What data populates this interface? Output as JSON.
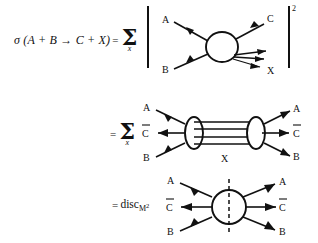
{
  "document": {
    "kind": "physics-equation-figure",
    "background_color": "#ffffff",
    "ink_color": "#111111"
  },
  "equation": {
    "line1": {
      "lhs": "σ (A + B → C + X)",
      "equals": "=",
      "sum_glyph": "Σ",
      "sum_subscript": "x",
      "amplitude_squared_exponent": "2"
    },
    "line2": {
      "equals": "=",
      "sum_glyph": "Σ",
      "sum_subscript": "x"
    },
    "line3": {
      "equals": "=",
      "operator": "disc",
      "operator_subscript": "M",
      "operator_subscript_exponent": "2"
    }
  },
  "diagram1": {
    "name": "amplitude-blob",
    "incoming": [
      "A",
      "B"
    ],
    "outgoing_single": "C",
    "outgoing_bundle_label": "X",
    "bundle_line_count": 3
  },
  "diagram2": {
    "name": "ladder-cut-diagram",
    "left_labels": [
      "A",
      "Ĉ",
      "B"
    ],
    "right_labels": [
      "A",
      "Ĉ",
      "B"
    ],
    "left_labels_plain": [
      "A",
      "C",
      "B"
    ],
    "right_labels_plain": [
      "A",
      "C",
      "B"
    ],
    "center_label": "X",
    "rung_count": 4
  },
  "diagram3": {
    "name": "discontinuity-blob",
    "left_labels_plain": [
      "A",
      "C",
      "B"
    ],
    "right_labels_plain": [
      "A",
      "C",
      "B"
    ],
    "cut_style": "dashed-vertical"
  }
}
